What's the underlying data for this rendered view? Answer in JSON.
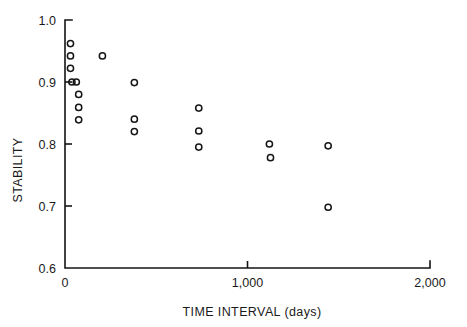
{
  "chart_data": {
    "type": "scatter",
    "title": "",
    "xlabel": "TIME INTERVAL (days)",
    "ylabel": "STABILITY",
    "xlim": [
      0,
      2000
    ],
    "ylim": [
      0.6,
      1.0
    ],
    "grid": false,
    "legend": null,
    "xticks": [
      0,
      1000,
      2000
    ],
    "xticklabels": [
      "0",
      "1,000",
      "2,000"
    ],
    "yticks": [
      0.6,
      0.7,
      0.8,
      0.9,
      1.0
    ],
    "yticklabels": [
      "0.6",
      "0.7",
      "0.8",
      "0.9",
      "1.0"
    ],
    "marker": "open-circle",
    "marker_color": "#151515",
    "points": [
      {
        "x": 30,
        "y": 0.962
      },
      {
        "x": 30,
        "y": 0.942
      },
      {
        "x": 30,
        "y": 0.922
      },
      {
        "x": 38,
        "y": 0.9
      },
      {
        "x": 62,
        "y": 0.9
      },
      {
        "x": 75,
        "y": 0.88
      },
      {
        "x": 75,
        "y": 0.859
      },
      {
        "x": 75,
        "y": 0.839
      },
      {
        "x": 205,
        "y": 0.942
      },
      {
        "x": 380,
        "y": 0.899
      },
      {
        "x": 380,
        "y": 0.84
      },
      {
        "x": 380,
        "y": 0.82
      },
      {
        "x": 733,
        "y": 0.858
      },
      {
        "x": 733,
        "y": 0.821
      },
      {
        "x": 733,
        "y": 0.795
      },
      {
        "x": 1120,
        "y": 0.8
      },
      {
        "x": 1126,
        "y": 0.778
      },
      {
        "x": 1442,
        "y": 0.797
      },
      {
        "x": 1442,
        "y": 0.698
      }
    ]
  },
  "colors": {
    "axis": "#141414",
    "marker": "#151515",
    "background": "#ffffff"
  }
}
